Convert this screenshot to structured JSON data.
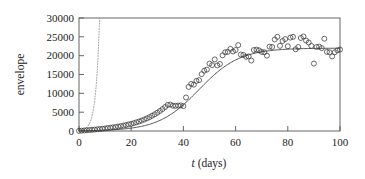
{
  "figure": {
    "background_color": "#ffffff",
    "frame_color": "#555555",
    "marker_color": "#3a3a3a",
    "fit_color": "#4a4a4a",
    "dotted_color": "#9a9a9a"
  },
  "axes": {
    "x_label_italic": "t",
    "x_label_rest": " (days)",
    "y_label": "envelope",
    "x_ticks": [
      "0",
      "20",
      "40",
      "60",
      "80",
      "100"
    ],
    "y_ticks": [
      "0",
      "5000",
      "10000",
      "15000",
      "20000",
      "25000",
      "30000"
    ]
  },
  "chart_data": {
    "type": "scatter",
    "title": "",
    "xlabel": "t (days)",
    "ylabel": "envelope",
    "xlim": [
      0,
      100
    ],
    "ylim": [
      0,
      30000
    ],
    "xticks": [
      0,
      20,
      40,
      60,
      80,
      100
    ],
    "yticks": [
      0,
      5000,
      10000,
      15000,
      20000,
      25000,
      30000
    ],
    "grid": false,
    "legend": null,
    "series": [
      {
        "name": "observed envelope",
        "type": "scatter",
        "marker": "open-circle",
        "points": [
          [
            0,
            40
          ],
          [
            1,
            90
          ],
          [
            2,
            150
          ],
          [
            3,
            210
          ],
          [
            4,
            260
          ],
          [
            5,
            320
          ],
          [
            6,
            380
          ],
          [
            7,
            450
          ],
          [
            8,
            520
          ],
          [
            9,
            600
          ],
          [
            10,
            680
          ],
          [
            11,
            770
          ],
          [
            12,
            860
          ],
          [
            13,
            960
          ],
          [
            14,
            1060
          ],
          [
            15,
            1180
          ],
          [
            16,
            1300
          ],
          [
            17,
            1430
          ],
          [
            18,
            1570
          ],
          [
            19,
            1730
          ],
          [
            20,
            1900
          ],
          [
            21,
            2080
          ],
          [
            22,
            2300
          ],
          [
            23,
            2520
          ],
          [
            24,
            2780
          ],
          [
            25,
            3050
          ],
          [
            26,
            3350
          ],
          [
            27,
            3680
          ],
          [
            28,
            4040
          ],
          [
            29,
            4430
          ],
          [
            30,
            4860
          ],
          [
            31,
            5320
          ],
          [
            32,
            5820
          ],
          [
            33,
            6360
          ],
          [
            34,
            6930
          ],
          [
            35,
            7020
          ],
          [
            36,
            6700
          ],
          [
            37,
            6680
          ],
          [
            38,
            6750
          ],
          [
            39,
            6800
          ],
          [
            40,
            6600
          ],
          [
            41,
            8900
          ],
          [
            42,
            11700
          ],
          [
            43,
            12500
          ],
          [
            44,
            12300
          ],
          [
            45,
            13300
          ],
          [
            46,
            13500
          ],
          [
            47,
            15100
          ],
          [
            48,
            16000
          ],
          [
            49,
            16300
          ],
          [
            50,
            17900
          ],
          [
            51,
            17500
          ],
          [
            52,
            19000
          ],
          [
            53,
            17400
          ],
          [
            54,
            17800
          ],
          [
            55,
            20100
          ],
          [
            56,
            20900
          ],
          [
            57,
            21000
          ],
          [
            58,
            21800
          ],
          [
            59,
            21100
          ],
          [
            60,
            21500
          ],
          [
            61,
            22800
          ],
          [
            62,
            20300
          ],
          [
            63,
            20200
          ],
          [
            64,
            19700
          ],
          [
            65,
            19800
          ],
          [
            66,
            18700
          ],
          [
            67,
            21500
          ],
          [
            68,
            21600
          ],
          [
            69,
            21400
          ],
          [
            70,
            21000
          ],
          [
            71,
            20900
          ],
          [
            72,
            20000
          ],
          [
            73,
            22400
          ],
          [
            74,
            22300
          ],
          [
            75,
            24300
          ],
          [
            76,
            25000
          ],
          [
            77,
            22600
          ],
          [
            78,
            23900
          ],
          [
            79,
            24400
          ],
          [
            80,
            22500
          ],
          [
            81,
            24800
          ],
          [
            82,
            25000
          ],
          [
            83,
            21700
          ],
          [
            84,
            22300
          ],
          [
            85,
            24700
          ],
          [
            86,
            25100
          ],
          [
            87,
            24000
          ],
          [
            88,
            23500
          ],
          [
            89,
            22600
          ],
          [
            90,
            17900
          ],
          [
            91,
            22300
          ],
          [
            92,
            22400
          ],
          [
            93,
            22000
          ],
          [
            94,
            24500
          ],
          [
            95,
            21000
          ],
          [
            96,
            20900
          ],
          [
            97,
            19800
          ],
          [
            98,
            20900
          ],
          [
            99,
            21400
          ],
          [
            100,
            21600
          ]
        ]
      },
      {
        "name": "logistic fit",
        "type": "line",
        "style": "solid",
        "description": "Logistic saturation curve, carrying capacity approx 22000, midpoint near t=46, growth rate approx 0.13 per day"
      },
      {
        "name": "exponential model",
        "type": "line",
        "style": "dotted",
        "description": "Unbounded exponential growth leaving the top of the frame near t=8"
      }
    ]
  }
}
